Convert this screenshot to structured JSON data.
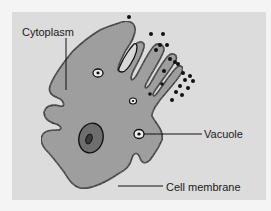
{
  "diagram": {
    "labels": {
      "cytoplasm": "Cytoplasm",
      "vacuole": "Vacuole",
      "cell_membrane": "Cell membrane"
    },
    "colors": {
      "background": "#f4f4f4",
      "panel": "#dcdcdc",
      "cytoplasm_fill": "#9a9a9a",
      "nucleus_fill": "#6e6e6e",
      "outline": "#111111"
    }
  }
}
